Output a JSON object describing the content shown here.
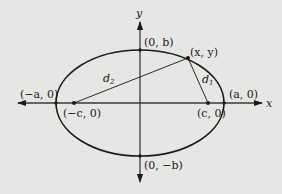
{
  "diagram": {
    "colors": {
      "background": "#e6e6e4",
      "stroke": "#1a1a1a"
    },
    "axes": {
      "x_label": "x",
      "y_label": "y"
    },
    "points": {
      "neg_a": {
        "label": "(−a, 0)"
      },
      "pos_a": {
        "label": "(a, 0)"
      },
      "pos_b": {
        "label": "(0, b)"
      },
      "neg_b": {
        "label": "(0, −b)"
      },
      "neg_c": {
        "label": "(−c, 0)"
      },
      "pos_c": {
        "label": "(c, 0)"
      },
      "point_xy": {
        "label": "(x, y)"
      }
    },
    "distances": {
      "d1": {
        "base": "d",
        "sub": "1"
      },
      "d2": {
        "base": "d",
        "sub": "2"
      }
    }
  }
}
